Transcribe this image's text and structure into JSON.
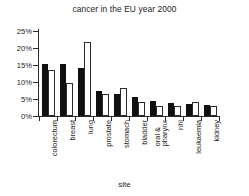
{
  "chart_data": {
    "type": "bar",
    "title": "cancer in the EU year 2000",
    "xlabel": "site",
    "ylabel": "",
    "ylim": [
      0,
      25
    ],
    "ytick_labels": [
      "0%",
      "5%",
      "10%",
      "15%",
      "20%",
      "25%"
    ],
    "ytick_values": [
      0,
      5,
      10,
      15,
      20,
      25
    ],
    "grid": false,
    "legend": "none",
    "categories": [
      "colorectum",
      "breast",
      "lung",
      "prostate",
      "stomach",
      "bladder",
      "oral & pharynx",
      "nhl",
      "leukaemia",
      "kidney"
    ],
    "series": [
      {
        "name": "series-1",
        "color": "#101010",
        "values": [
          15.2,
          15.2,
          14.1,
          7.5,
          6.4,
          5.6,
          4.4,
          3.8,
          3.4,
          3.1
        ]
      },
      {
        "name": "series-2",
        "color": "#ffffff",
        "values": [
          13.4,
          9.7,
          21.8,
          6.5,
          8.2,
          4.1,
          2.9,
          3.0,
          4.0,
          3.0
        ]
      }
    ]
  },
  "colors": {
    "axis": "#2a2a2a",
    "text": "#1c1c1c",
    "background": "#ffffff",
    "bar_dark": "#101010",
    "bar_light": "#ffffff",
    "bar_light_edge": "#2b2b2b"
  }
}
